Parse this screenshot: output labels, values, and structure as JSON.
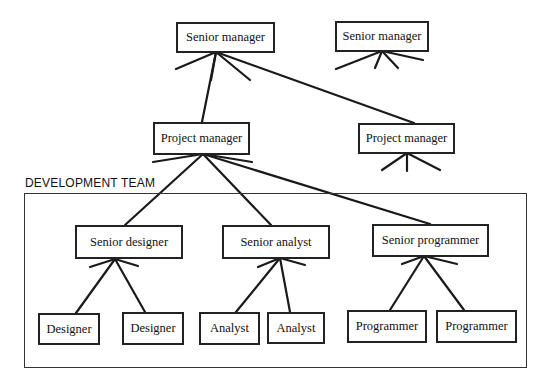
{
  "diagram": {
    "type": "org-chart",
    "team_label": "DEVELOPMENT TEAM",
    "nodes": {
      "senior_manager_1": "Senior manager",
      "senior_manager_2": "Senior manager",
      "project_manager_1": "Project manager",
      "project_manager_2": "Project manager",
      "senior_designer": "Senior designer",
      "senior_analyst": "Senior analyst",
      "senior_programmer": "Senior programmer",
      "designer_1": "Designer",
      "designer_2": "Designer",
      "analyst_1": "Analyst",
      "analyst_2": "Analyst",
      "programmer_1": "Programmer",
      "programmer_2": "Programmer"
    },
    "edges": [
      [
        "senior_manager_1",
        "project_manager_1"
      ],
      [
        "senior_manager_1",
        "project_manager_2"
      ],
      [
        "project_manager_1",
        "senior_designer"
      ],
      [
        "project_manager_1",
        "senior_analyst"
      ],
      [
        "project_manager_1",
        "senior_programmer"
      ],
      [
        "senior_designer",
        "designer_1"
      ],
      [
        "senior_designer",
        "designer_2"
      ],
      [
        "senior_analyst",
        "analyst_1"
      ],
      [
        "senior_analyst",
        "analyst_2"
      ],
      [
        "senior_programmer",
        "programmer_1"
      ],
      [
        "senior_programmer",
        "programmer_2"
      ]
    ]
  }
}
